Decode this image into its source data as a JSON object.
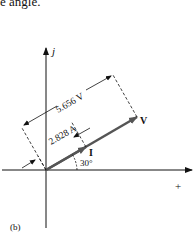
{
  "caption_top": "e angle.",
  "axes": {
    "imag_label": "j",
    "real_label": "+"
  },
  "phasors": {
    "voltage": {
      "label": "V",
      "magnitude_label": "5.656 V"
    },
    "current": {
      "label": "I",
      "magnitude_label": "2.828 A"
    },
    "angle_label": "30°"
  },
  "figure_label": "(b)",
  "colors": {
    "ink": "#111111",
    "phasor": "#555555"
  }
}
